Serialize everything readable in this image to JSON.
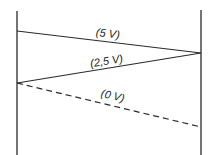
{
  "diagram": {
    "type": "voltage-transition-diagram",
    "colors": {
      "line": "#2a2a2a",
      "background": "#ffffff"
    },
    "labels": {
      "high": "(5 V)",
      "mid": "(2,5 V)",
      "low": "(0 V)"
    },
    "rails": {
      "left_x": 17,
      "right_x": 201
    },
    "segments": [
      {
        "name": "high",
        "label": "(5 V)",
        "from": [
          17,
          31
        ],
        "to": [
          201,
          53
        ],
        "style": "solid"
      },
      {
        "name": "mid",
        "label": "(2,5 V)",
        "from": [
          201,
          53
        ],
        "to": [
          17,
          83
        ],
        "style": "solid"
      },
      {
        "name": "low",
        "label": "(0 V)",
        "from": [
          17,
          83
        ],
        "to": [
          201,
          127
        ],
        "style": "dashed"
      }
    ]
  }
}
